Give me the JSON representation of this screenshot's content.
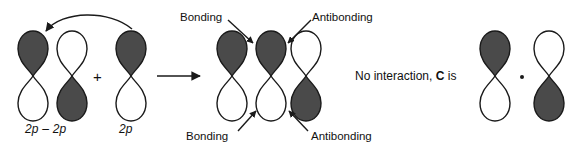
{
  "figure": {
    "colors": {
      "lobe_dark": "#4a4a4a",
      "lobe_light": "#ffffff",
      "stroke": "#1a1a1a",
      "text": "#111111",
      "background": "#ffffff"
    }
  },
  "reactants": {
    "group_label": "2p – 2p",
    "single_label": "2p",
    "plus_sign": "+",
    "orbitals": [
      {
        "name": "reactant-orbital-1",
        "top_lobe": "dark",
        "bottom_lobe": "light"
      },
      {
        "name": "reactant-orbital-2",
        "top_lobe": "light",
        "bottom_lobe": "dark"
      },
      {
        "name": "reactant-orbital-3",
        "top_lobe": "dark",
        "bottom_lobe": "light"
      }
    ]
  },
  "product": {
    "orbitals": [
      {
        "name": "product-orbital-1",
        "top_lobe": "dark",
        "bottom_lobe": "light"
      },
      {
        "name": "product-orbital-2",
        "top_lobe": "dark",
        "bottom_lobe": "light"
      },
      {
        "name": "product-orbital-3",
        "top_lobe": "light",
        "bottom_lobe": "dark"
      }
    ],
    "annotations": {
      "bonding_top": "Bonding",
      "antibonding_top": "Antibonding",
      "bonding_bottom": "Bonding",
      "antibonding_bottom": "Antibonding"
    }
  },
  "no_interaction": {
    "text_before": "No interaction, ",
    "bold_symbol": "C",
    "text_after": " is",
    "dot_separator": "·",
    "orbitals": [
      {
        "name": "noninteracting-orbital-1",
        "top_lobe": "dark",
        "bottom_lobe": "light"
      },
      {
        "name": "noninteracting-orbital-2",
        "top_lobe": "light",
        "bottom_lobe": "dark"
      }
    ]
  }
}
